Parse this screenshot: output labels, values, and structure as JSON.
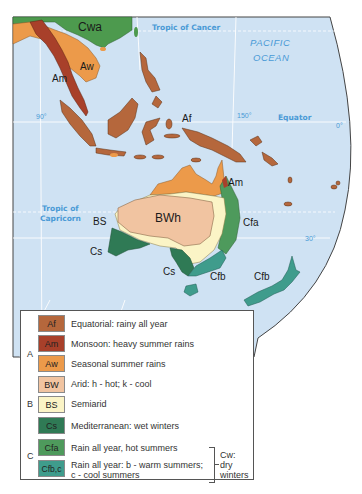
{
  "map": {
    "title": "Climate regions of Southeast Asia and Australia",
    "labels": {
      "tropic_cancer": "Tropic of Cancer",
      "tropic_capricorn_1": "Tropic of",
      "tropic_capricorn_2": "Capricorn",
      "equator": "Equator",
      "pacific_1": "PACIFIC",
      "pacific_2": "OCEAN",
      "lon_90": "90°",
      "lon_150": "150°",
      "lat_0": "0°",
      "lat_30": "30°"
    },
    "region_labels": {
      "cwa": "Cwa",
      "aw": "Aw",
      "am_asia": "Am",
      "af": "Af",
      "am_aus": "Am",
      "bs": "BS",
      "bwh": "BWh",
      "cfa": "Cfa",
      "cs_west": "Cs",
      "cs_south": "Cs",
      "cfb_tas": "Cfb",
      "cfb_nz": "Cfb"
    },
    "colors": {
      "ocean": "#cfe2f3",
      "Af": "#b5673c",
      "Am": "#a8402a",
      "Aw": "#ec9a4a",
      "BW": "#f1c4a1",
      "BS": "#fbf4c6",
      "Cs": "#2f7a55",
      "Cfa": "#4e9a5c",
      "Cfb": "#3f9c8c",
      "Cwa": "#4d9a4e"
    }
  },
  "legend": {
    "groups": {
      "A": "A",
      "B": "B",
      "C": "C"
    },
    "items": [
      {
        "code": "Af",
        "desc": "Equatorial: rainy all year",
        "color": "#b5673c"
      },
      {
        "code": "Am",
        "desc": "Monsoon: heavy summer rains",
        "color": "#a8402a"
      },
      {
        "code": "Aw",
        "desc": "Seasonal summer rains",
        "color": "#ec9a4a"
      },
      {
        "code": "BW",
        "desc": "Arid: h - hot; k - cool",
        "color": "#f1c4a1"
      },
      {
        "code": "BS",
        "desc": "Semiarid",
        "color": "#fbf4c6"
      },
      {
        "code": "Cs",
        "desc": "Mediterranean: wet winters",
        "color": "#2f7a55"
      },
      {
        "code": "Cfa",
        "desc": "Rain all year, hot summers",
        "color": "#4e9a5c"
      },
      {
        "code": "Cfb,c",
        "desc_line1": "Rain all year: b - warm summers;",
        "desc_line2": "c - cool summers",
        "color": "#3f9c8c"
      }
    ],
    "cw_note": {
      "line1": "Cw:",
      "line2": "dry",
      "line3": "winters"
    }
  }
}
